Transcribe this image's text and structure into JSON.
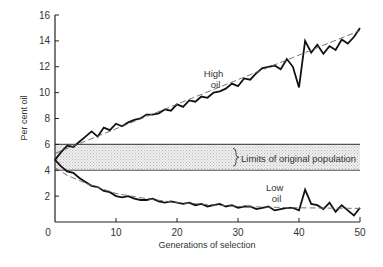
{
  "chart_data": {
    "type": "line",
    "title": "",
    "xlabel": "Generations of selection",
    "ylabel": "Per cent oil",
    "xlim": [
      0,
      50
    ],
    "ylim": [
      0,
      16
    ],
    "x_ticks": [
      0,
      10,
      20,
      30,
      40,
      50
    ],
    "y_ticks": [
      2,
      4,
      6,
      8,
      10,
      12,
      14,
      16
    ],
    "grid": false,
    "band": {
      "label": "Limits of original population",
      "y_low": 4,
      "y_high": 6
    },
    "annotations": [
      {
        "text": [
          "High",
          "oil"
        ],
        "x": 26,
        "y": 11.2
      },
      {
        "text": [
          "Low",
          "oil"
        ],
        "x": 36,
        "y": 2.4
      }
    ],
    "series": [
      {
        "name": "High oil",
        "x": [
          0,
          1,
          2,
          3,
          4,
          5,
          6,
          7,
          8,
          9,
          10,
          11,
          12,
          13,
          14,
          15,
          16,
          17,
          18,
          19,
          20,
          21,
          22,
          23,
          24,
          25,
          26,
          27,
          28,
          29,
          30,
          31,
          32,
          33,
          34,
          35,
          36,
          37,
          38,
          39,
          40,
          41,
          42,
          43,
          44,
          45,
          46,
          47,
          48,
          49,
          50
        ],
        "values": [
          4.8,
          5.4,
          5.9,
          5.8,
          6.2,
          6.6,
          7.0,
          6.6,
          7.3,
          7.1,
          7.6,
          7.4,
          7.7,
          7.9,
          8.0,
          8.3,
          8.3,
          8.4,
          8.7,
          8.6,
          9.1,
          8.9,
          9.4,
          9.3,
          9.7,
          9.6,
          10.0,
          10.1,
          10.3,
          10.7,
          10.5,
          11.1,
          11.0,
          11.5,
          11.9,
          12.0,
          12.1,
          11.8,
          12.6,
          12.0,
          10.4,
          14.0,
          13.1,
          13.7,
          13.0,
          13.6,
          13.3,
          14.1,
          13.8,
          14.3,
          15.0
        ]
      },
      {
        "name": "High oil trend",
        "style": "dashed",
        "x": [
          0,
          50
        ],
        "values": [
          5.3,
          14.8
        ]
      },
      {
        "name": "Low oil",
        "x": [
          0,
          1,
          2,
          3,
          4,
          5,
          6,
          7,
          8,
          9,
          10,
          11,
          12,
          13,
          14,
          15,
          16,
          17,
          18,
          19,
          20,
          21,
          22,
          23,
          24,
          25,
          26,
          27,
          28,
          29,
          30,
          31,
          32,
          33,
          34,
          35,
          36,
          37,
          38,
          39,
          40,
          41,
          42,
          43,
          44,
          45,
          46,
          47,
          48,
          49,
          50
        ],
        "values": [
          4.8,
          4.3,
          3.9,
          3.8,
          3.4,
          3.1,
          2.8,
          2.7,
          2.4,
          2.3,
          2.0,
          1.9,
          2.0,
          1.8,
          1.7,
          1.7,
          1.8,
          1.6,
          1.5,
          1.6,
          1.5,
          1.4,
          1.5,
          1.3,
          1.4,
          1.2,
          1.3,
          1.4,
          1.2,
          1.3,
          1.1,
          1.2,
          1.2,
          1.0,
          1.1,
          1.2,
          0.9,
          1.0,
          1.1,
          1.1,
          0.9,
          2.5,
          1.4,
          1.3,
          1.0,
          1.5,
          0.8,
          1.3,
          0.9,
          0.5,
          1.1
        ]
      },
      {
        "name": "Low oil trend",
        "style": "dashed",
        "x": [
          0,
          2,
          5,
          10,
          15,
          20,
          30,
          40,
          50
        ],
        "values": [
          4.2,
          3.6,
          3.0,
          2.2,
          1.8,
          1.5,
          1.2,
          1.1,
          1.05
        ]
      }
    ]
  }
}
